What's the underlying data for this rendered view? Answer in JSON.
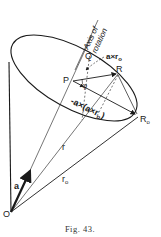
{
  "figure": {
    "caption": "Fig. 43.",
    "labels": {
      "axis_line1": "Axis of",
      "axis_line2": "rotation",
      "Q": "Q",
      "P": "P",
      "R": "R",
      "R0": "R",
      "R0_sub": "o",
      "O": "O",
      "phi": "φ",
      "a_cross_r0": "a×r",
      "a_cross_r0_sub": "o",
      "neg_triple": "-a×(a×r",
      "neg_triple_sub": "o",
      "neg_triple_close": ")",
      "r": "r",
      "r0": "r",
      "r0_sub": "o",
      "a": "a"
    },
    "colors": {
      "ink": "#1a1a1a",
      "background": "#ffffff"
    }
  }
}
